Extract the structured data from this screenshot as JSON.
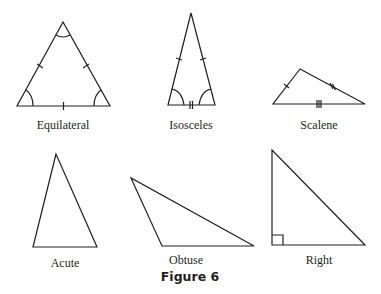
{
  "figure": {
    "caption": "Figure 6",
    "stroke_color": "#231f20",
    "triangles": [
      {
        "label": "Equilateral",
        "vertices": [
          [
            63,
            22
          ],
          [
            17,
            106
          ],
          [
            110,
            106
          ]
        ],
        "marks": "3 equal sides (single tick each), 3 equal angles (arc at each vertex)"
      },
      {
        "label": "Isosceles",
        "vertices": [
          [
            191,
            13
          ],
          [
            168,
            105
          ],
          [
            215,
            105
          ]
        ],
        "marks": "2 equal sides (single tick), base with double tick, 2 equal base angles (arcs)"
      },
      {
        "label": "Scalene",
        "vertices": [
          [
            300,
            69
          ],
          [
            273,
            104
          ],
          [
            365,
            104
          ]
        ],
        "marks": "sides marked with 1, 2 and 3 ticks (all different)"
      },
      {
        "label": "Acute",
        "vertices": [
          [
            56,
            154
          ],
          [
            33,
            247
          ],
          [
            97,
            247
          ]
        ],
        "marks": "none"
      },
      {
        "label": "Obtuse",
        "vertices": [
          [
            131,
            178
          ],
          [
            162,
            246
          ],
          [
            254,
            246
          ]
        ],
        "marks": "none"
      },
      {
        "label": "Right",
        "vertices": [
          [
            272,
            150
          ],
          [
            272,
            245
          ],
          [
            365,
            245
          ]
        ],
        "marks": "right-angle square at bottom-left"
      }
    ]
  }
}
